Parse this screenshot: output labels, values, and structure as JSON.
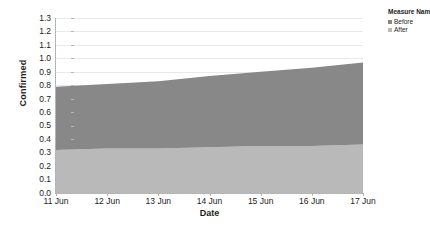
{
  "chart_data": {
    "type": "area",
    "stacked": true,
    "title": "",
    "xlabel": "Date",
    "ylabel": "Confirmed",
    "categories": [
      "11 Jun",
      "12 Jun",
      "13 Jun",
      "14 Jun",
      "15 Jun",
      "16 Jun",
      "17 Jun"
    ],
    "x_tick_labels": [
      "11 Jun",
      "12 Jun",
      "13 Jun",
      "14 Jun",
      "15 Jun",
      "16 Jun",
      "17 Jun"
    ],
    "y_tick_labels": [
      "0.0",
      "0.1",
      "0.2",
      "0.3",
      "0.4",
      "0.5",
      "0.6",
      "0.7",
      "0.8",
      "0.9",
      "1.0",
      "1.1",
      "1.2",
      "1.3"
    ],
    "y_tick_values": [
      0.0,
      0.1,
      0.2,
      0.3,
      0.4,
      0.5,
      0.6,
      0.7,
      0.8,
      0.9,
      1.0,
      1.1,
      1.2,
      1.3
    ],
    "ylim": [
      0.0,
      1.3
    ],
    "grid": "horizontal",
    "legend_position": "top-right",
    "series": [
      {
        "name": "Before",
        "color": "#888888",
        "values": [
          0.47,
          0.48,
          0.5,
          0.53,
          0.55,
          0.58,
          0.61
        ]
      },
      {
        "name": "After",
        "color": "#b9b9b9",
        "values": [
          0.32,
          0.33,
          0.33,
          0.34,
          0.35,
          0.35,
          0.36
        ]
      }
    ],
    "stack_tops": {
      "After": [
        0.32,
        0.33,
        0.33,
        0.34,
        0.35,
        0.35,
        0.36
      ],
      "Before": [
        0.79,
        0.81,
        0.83,
        0.87,
        0.9,
        0.93,
        0.97
      ]
    }
  },
  "legend": {
    "title": "Measure Names",
    "items": [
      {
        "label": "Before",
        "color": "#888888"
      },
      {
        "label": "After",
        "color": "#b9b9b9"
      }
    ]
  },
  "axes": {
    "y_title": "Confirmed",
    "x_title": "Date"
  },
  "colors": {
    "before": "#888888",
    "after": "#b9b9b9",
    "grid": "#e9e9e9",
    "axis": "#b5b5b5",
    "text": "#1c1c1c",
    "background": "#ffffff"
  }
}
